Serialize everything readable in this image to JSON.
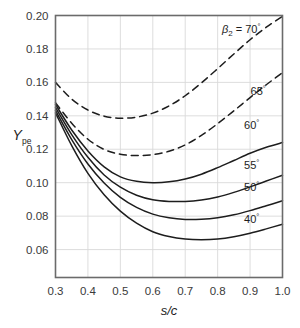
{
  "figure": {
    "background": "#ffffff",
    "frame_color": "#6b6b6b",
    "grid_color": "#d9d9d9",
    "curve_color": "#1d1d1d"
  },
  "axes": {
    "x": {
      "label_main": "s/c",
      "label_plain": "s/c",
      "ticks": [
        "0.3",
        "0.4",
        "0.5",
        "0.6",
        "0.7",
        "0.8",
        "0.9",
        "1.0"
      ],
      "min": 0.3,
      "max": 1.0
    },
    "y": {
      "label_main": "Y",
      "label_sub": "pe",
      "ticks": [
        "0.06",
        "0.08",
        "0.10",
        "0.12",
        "0.14",
        "0.16",
        "0.18",
        "0.20"
      ],
      "min": 0.0433,
      "max": 0.2
    }
  },
  "annotations": {
    "beta_prefix": "β",
    "beta_sub": "2",
    "beta_eq": " = ",
    "degree": "°"
  },
  "chart_data": {
    "type": "line",
    "title": "",
    "xlabel": "s/c",
    "ylabel": "Y_pe",
    "xlim": [
      0.3,
      1.0
    ],
    "ylim": [
      0.0433,
      0.2
    ],
    "grid": true,
    "legend": "inline-right-labels",
    "x": [
      0.3,
      0.35,
      0.4,
      0.45,
      0.5,
      0.55,
      0.6,
      0.65,
      0.7,
      0.75,
      0.8,
      0.85,
      0.9,
      0.95,
      1.0
    ],
    "series": [
      {
        "name": "70",
        "label": "β₂ = 70°",
        "style": "dashed",
        "label_x": 0.885,
        "label_y": 0.1895,
        "values": [
          0.16,
          0.15,
          0.1435,
          0.1398,
          0.1386,
          0.1392,
          0.1416,
          0.1459,
          0.152,
          0.1597,
          0.1682,
          0.177,
          0.1855,
          0.193,
          0.1995
        ]
      },
      {
        "name": "65",
        "label": "65°",
        "style": "dashed",
        "label_x": 0.925,
        "label_y": 0.1525,
        "values": [
          0.1478,
          0.1356,
          0.126,
          0.1199,
          0.117,
          0.1162,
          0.1168,
          0.1188,
          0.1226,
          0.1283,
          0.1353,
          0.143,
          0.1509,
          0.1586,
          0.1658
        ]
      },
      {
        "name": "60",
        "label": "60°",
        "style": "solid",
        "label_x": 0.905,
        "label_y": 0.132,
        "values": [
          0.1468,
          0.1315,
          0.119,
          0.1095,
          0.1035,
          0.1008,
          0.1,
          0.1005,
          0.1022,
          0.1051,
          0.109,
          0.1133,
          0.1176,
          0.1212,
          0.124
        ]
      },
      {
        "name": "55",
        "label": "55°",
        "style": "solid",
        "label_x": 0.905,
        "label_y": 0.108,
        "values": [
          0.145,
          0.1288,
          0.1152,
          0.1046,
          0.0973,
          0.0925,
          0.0898,
          0.0888,
          0.0888,
          0.0897,
          0.0915,
          0.0942,
          0.0975,
          0.101,
          0.1045
        ]
      },
      {
        "name": "50",
        "label": "50°",
        "style": "solid",
        "label_x": 0.905,
        "label_y": 0.095,
        "values": [
          0.1432,
          0.1258,
          0.1112,
          0.0998,
          0.0912,
          0.0852,
          0.0812,
          0.079,
          0.078,
          0.0781,
          0.079,
          0.0808,
          0.0833,
          0.0862,
          0.0892
        ]
      },
      {
        "name": "40",
        "label": "40°",
        "style": "solid",
        "label_x": 0.905,
        "label_y": 0.076,
        "values": [
          0.1418,
          0.1222,
          0.1056,
          0.0928,
          0.083,
          0.0758,
          0.0707,
          0.0678,
          0.0663,
          0.0659,
          0.0663,
          0.0677,
          0.0698,
          0.0724,
          0.0752
        ]
      }
    ]
  }
}
